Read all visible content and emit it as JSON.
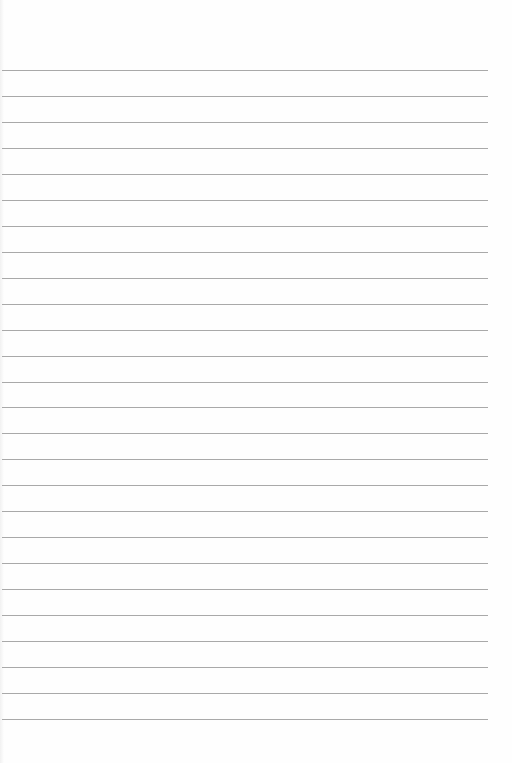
{
  "page": {
    "type": "lined-paper",
    "background_color": "#fefefe",
    "rule_color": "#a9a9a9",
    "rule_count": 26,
    "first_rule_y": 70,
    "rule_spacing": 25.96,
    "rule_left": 2,
    "rule_right": 488
  }
}
